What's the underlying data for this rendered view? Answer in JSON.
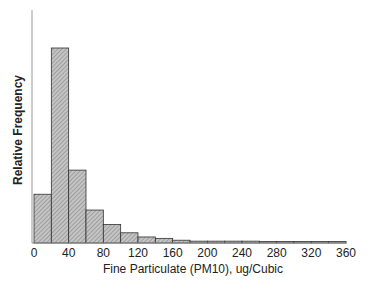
{
  "chart_data": {
    "type": "bar",
    "title": "",
    "xlabel": "Fine Particulate (PM10), ug/Cubic",
    "ylabel": "Relative Frequency",
    "bin_width": 20,
    "bins": [
      0,
      20,
      40,
      60,
      80,
      100,
      120,
      140,
      160,
      180,
      200,
      220,
      240,
      260,
      280,
      300,
      320,
      340
    ],
    "values": [
      0.105,
      0.42,
      0.157,
      0.071,
      0.04,
      0.022,
      0.013,
      0.01,
      0.006,
      0.004,
      0.004,
      0.004,
      0.004,
      0.002,
      0.002,
      0.002,
      0.002,
      0.002
    ],
    "x_ticks": [
      "0",
      "40",
      "80",
      "120",
      "160",
      "200",
      "240",
      "280",
      "320",
      "360"
    ],
    "xlim": [
      0,
      360
    ],
    "grid": false,
    "legend": null,
    "fill_color": "#b8b8b8",
    "edge_color": "#333333"
  }
}
